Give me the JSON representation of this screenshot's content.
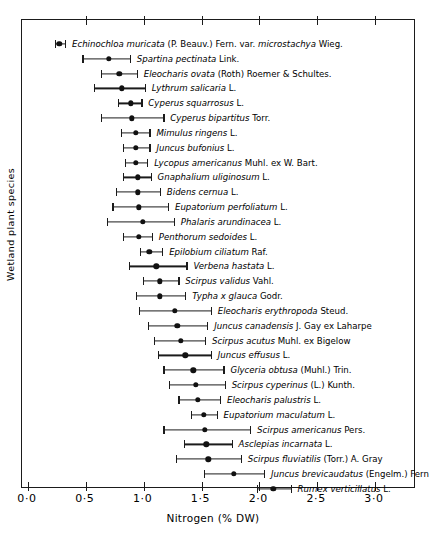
{
  "chart_data": {
    "type": "scatter",
    "title": "",
    "xlabel": "Nitrogen (% DW)",
    "ylabel": "Wetland plant species",
    "xlim": [
      0.0,
      3.4
    ],
    "xticks": [
      0.0,
      0.5,
      1.0,
      1.5,
      2.0,
      2.5,
      3.0
    ],
    "xticklabels": [
      "0·0",
      "0·5",
      "1·0",
      "1·5",
      "2·0",
      "2·5",
      "3·0"
    ],
    "grid": false,
    "legend": "none",
    "orientation": "horizontal",
    "error_style": "mean with range bars and end caps",
    "points": [
      {
        "label_italic": "Echinochloa muricata",
        "label_auth": "(P. Beauv.) Fern. var.",
        "label_italic2": "microstachya",
        "label_auth2": "Wieg.",
        "mean": 0.27,
        "low": 0.23,
        "high": 0.32
      },
      {
        "label_italic": "Spartina pectinata",
        "label_auth": "Link.",
        "mean": 0.7,
        "low": 0.47,
        "high": 0.88
      },
      {
        "label_italic": "Eleocharis ovata",
        "label_auth": "(Roth) Roemer & Schultes.",
        "mean": 0.79,
        "low": 0.63,
        "high": 0.94
      },
      {
        "label_italic": "Lythrum salicaria",
        "label_auth": "L.",
        "mean": 0.81,
        "low": 0.57,
        "high": 1.01
      },
      {
        "label_italic": "Cyperus squarrosus",
        "label_auth": "L.",
        "mean": 0.89,
        "low": 0.78,
        "high": 0.98
      },
      {
        "label_italic": "Cyperus bipartitus",
        "label_auth": "Torr.",
        "mean": 0.9,
        "low": 0.63,
        "high": 1.17
      },
      {
        "label_italic": "Mimulus ringens",
        "label_auth": "L.",
        "mean": 0.93,
        "low": 0.8,
        "high": 1.05
      },
      {
        "label_italic": "Juncus bufonius",
        "label_auth": "L.",
        "mean": 0.93,
        "low": 0.82,
        "high": 1.05
      },
      {
        "label_italic": "Lycopus americanus",
        "label_auth": "Muhl. ex W. Bart.",
        "mean": 0.93,
        "low": 0.84,
        "high": 1.03
      },
      {
        "label_italic": "Gnaphalium uliginosum",
        "label_auth": "L.",
        "mean": 0.95,
        "low": 0.82,
        "high": 1.06
      },
      {
        "label_italic": "Bidens cernua",
        "label_auth": "L.",
        "mean": 0.95,
        "low": 0.76,
        "high": 1.14
      },
      {
        "label_italic": "Eupatorium perfoliatum",
        "label_auth": "L.",
        "mean": 0.96,
        "low": 0.73,
        "high": 1.21
      },
      {
        "label_italic": "Phalaris arundinacea",
        "label_auth": "L.",
        "mean": 0.99,
        "low": 0.68,
        "high": 1.26
      },
      {
        "label_italic": "Penthorum sedoides",
        "label_auth": "L.",
        "mean": 0.96,
        "low": 0.82,
        "high": 1.07
      },
      {
        "label_italic": "Epilobium ciliatum",
        "label_auth": "Raf.",
        "mean": 1.05,
        "low": 0.97,
        "high": 1.16
      },
      {
        "label_italic": "Verbena hastata",
        "label_auth": "L.",
        "mean": 1.11,
        "low": 0.87,
        "high": 1.37
      },
      {
        "label_italic": "Scirpus validus",
        "label_auth": "Vahl.",
        "mean": 1.14,
        "low": 0.99,
        "high": 1.3
      },
      {
        "label_italic": "Typha x glauca",
        "label_auth": "Godr.",
        "mean": 1.14,
        "low": 0.93,
        "high": 1.36
      },
      {
        "label_italic": "Eleocharis erythropoda",
        "label_auth": "Steud.",
        "mean": 1.27,
        "low": 0.96,
        "high": 1.58
      },
      {
        "label_italic": "Juncus canadensis",
        "label_auth": "J. Gay ex Laharpe",
        "mean": 1.29,
        "low": 1.04,
        "high": 1.55
      },
      {
        "label_italic": "Scirpus acutus",
        "label_auth": "Muhl. ex Bigelow",
        "mean": 1.32,
        "low": 1.09,
        "high": 1.53
      },
      {
        "label_italic": "Juncus effusus",
        "label_auth": "L.",
        "mean": 1.36,
        "low": 1.12,
        "high": 1.58
      },
      {
        "label_italic": "Glyceria obtusa",
        "label_auth": "(Muhl.) Trin.",
        "mean": 1.43,
        "low": 1.17,
        "high": 1.69
      },
      {
        "label_italic": "Scirpus cyperinus",
        "label_auth": "(L.) Kunth.",
        "mean": 1.45,
        "low": 1.22,
        "high": 1.7
      },
      {
        "label_italic": "Eleocharis palustris",
        "label_auth": "L.",
        "mean": 1.47,
        "low": 1.3,
        "high": 1.66
      },
      {
        "label_italic": "Eupatorium maculatum",
        "label_auth": "L.",
        "mean": 1.52,
        "low": 1.41,
        "high": 1.63
      },
      {
        "label_italic": "Scirpus americanus",
        "label_auth": "Pers.",
        "mean": 1.53,
        "low": 1.17,
        "high": 1.92
      },
      {
        "label_italic": "Asclepias incarnata",
        "label_auth": "L.",
        "mean": 1.54,
        "low": 1.35,
        "high": 1.76
      },
      {
        "label_italic": "Scirpus fluviatilis",
        "label_auth": "(Torr.) A. Gray",
        "mean": 1.56,
        "low": 1.28,
        "high": 1.84
      },
      {
        "label_italic": "Juncus brevicaudatus",
        "label_auth": "(Engelm.) Fern",
        "mean": 1.78,
        "low": 1.52,
        "high": 2.04
      },
      {
        "label_italic": "Rumex verticillatus",
        "label_auth": "L.",
        "mean": 2.12,
        "low": 1.98,
        "high": 2.27
      }
    ]
  }
}
